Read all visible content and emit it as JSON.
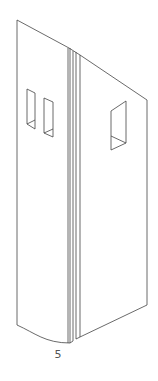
{
  "figure": {
    "label": "5",
    "stroke_color": "#444444",
    "background": "#ffffff"
  }
}
